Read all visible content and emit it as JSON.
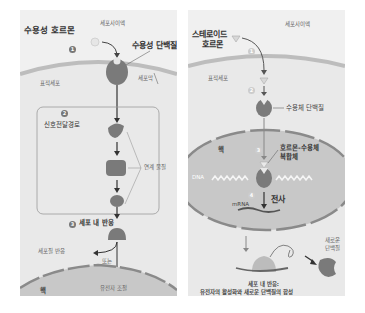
{
  "left": {
    "title": "수용성 호르몬",
    "extracellular": "세포사이액",
    "receptor": "수용성 단백질",
    "membrane": "세포막",
    "target_cell": "표적세포",
    "step1": "1",
    "step2": "2",
    "step3": "3",
    "pathway": "신호전달경로",
    "relay": "연계 물질",
    "response": "세포 내 반응",
    "cytoplasm_response": "세포질 반응",
    "or": "또는",
    "gene_regulation": "유전자 조절",
    "nucleus": "핵"
  },
  "right": {
    "title_line1": "스테로이드",
    "title_line2": "호르몬",
    "extracellular": "세포사이액",
    "target_cell": "표적세포",
    "step1": "1",
    "step2": "2",
    "step3": "3",
    "step4": "4",
    "receptor": "수용체 단백질",
    "nucleus": "핵",
    "complex_line1": "호르몬-수용체",
    "complex_line2": "복합체",
    "dna": "DNA",
    "transcription": "전사",
    "mrna": "mRNA",
    "new_protein_line1": "새로운",
    "new_protein_line2": "단백질",
    "response_line1": "세포 내 반응:",
    "response_line2": "유전자의 활성화와 새로운 단백질의 합성"
  },
  "colors": {
    "panel_bg": "#f0f0f0",
    "cell_fill": "#e9e9e9",
    "membrane": "#bdbdbd",
    "protein": "#7a7a7a",
    "nucleus_fill": "#c8c8c8",
    "nucleus_edge": "#8a8a8a"
  }
}
